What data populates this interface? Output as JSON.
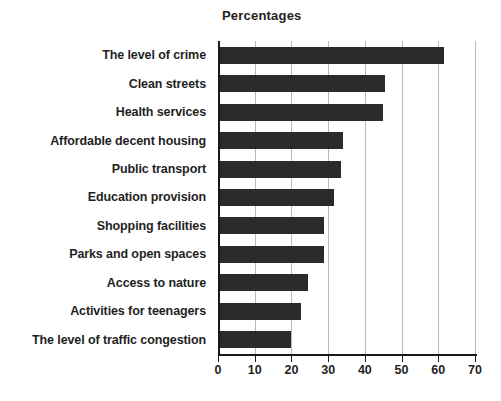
{
  "chart_data": {
    "type": "bar",
    "orientation": "horizontal",
    "title": "Percentages",
    "xlabel": "",
    "ylabel": "",
    "xlim": [
      0,
      70
    ],
    "xticks": [
      0,
      10,
      20,
      30,
      40,
      50,
      60,
      70
    ],
    "grid": true,
    "legend": false,
    "bar_color": "#2b2b2b",
    "categories": [
      "The level of crime",
      "Clean streets",
      "Health services",
      "Affordable decent housing",
      "Public transport",
      "Education provision",
      "Shopping facilities",
      "Parks and open spaces",
      "Access to nature",
      "Activities for teenagers",
      "The level of traffic congestion"
    ],
    "values": [
      61.5,
      45.5,
      45,
      34,
      33.5,
      31.5,
      29,
      29,
      24.5,
      22.5,
      20
    ]
  }
}
